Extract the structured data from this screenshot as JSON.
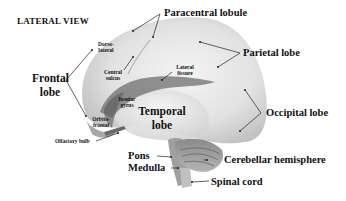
{
  "title": "LATERAL VIEW",
  "labels": {
    "paracentral_lobule": "Paracentral lobule",
    "parietal_lobe": "Parietal lobe",
    "occipital_lobe": "Occipital lobe",
    "frontal_lobe_1": "Frontal",
    "frontal_lobe_2": "lobe",
    "temporal_lobe_1": "Temporal",
    "temporal_lobe_2": "lobe",
    "dorsolateral_1": "Dorso-",
    "dorsolateral_2": "lateral",
    "central_sulcus_1": "Central",
    "central_sulcus_2": "sulcus",
    "lateral_fissure_1": "Lateral",
    "lateral_fissure_2": "fissure",
    "insular_gyrus_1": "Insular",
    "insular_gyrus_2": "gyrus",
    "orbitofrontal_1": "Orbito-",
    "orbitofrontal_2": "frontal",
    "olfactory_bulb": "Olfactory bulb",
    "pons": "Pons",
    "medulla": "Medulla",
    "cerebellar_hemisphere": "Cerebellar hemisphere",
    "spinal_cord": "Spinal cord"
  },
  "colors": {
    "background": "#ffffff",
    "text": "#111111",
    "brain_light": "#eeeeee",
    "brain_mid": "#c8c8c8",
    "brain_dark": "#7a7a7a",
    "leader_line": "#222222"
  }
}
